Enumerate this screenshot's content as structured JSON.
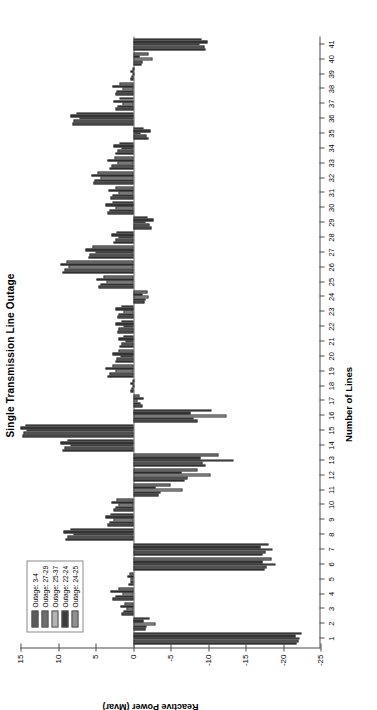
{
  "figure": {
    "title": "Single Transmission Line Outage",
    "xlabel": "Number of Lines",
    "ylabel": "Reactive Power (Mvar)"
  },
  "legend": {
    "items": [
      {
        "label": "Outage: 3-4",
        "color": "#5a5a5a"
      },
      {
        "label": "Outage: 27-29",
        "color": "#6e6e6e"
      },
      {
        "label": "Outage: 25-37",
        "color": "#b4b4b4"
      },
      {
        "label": "Outage: 22-24",
        "color": "#3c3c3c"
      },
      {
        "label": "Outage: 24-25",
        "color": "#909090"
      }
    ]
  },
  "axis": {
    "y_ticks": [
      15,
      10,
      5,
      0,
      -5,
      -10,
      -15,
      -20,
      -25
    ],
    "y_min": -25,
    "y_max": 15,
    "x_ticks": [
      1,
      2,
      3,
      4,
      5,
      6,
      7,
      8,
      9,
      10,
      11,
      12,
      13,
      14,
      15,
      16,
      17,
      18,
      19,
      20,
      21,
      22,
      23,
      24,
      25,
      26,
      27,
      28,
      29,
      30,
      31,
      32,
      33,
      34,
      35,
      36,
      37,
      38,
      39,
      40,
      41
    ],
    "x_min": 0.4,
    "x_max": 41.6
  },
  "chart_data": {
    "type": "bar",
    "title": "Single Transmission Line Outage",
    "xlabel": "Number of Lines",
    "ylabel": "Reactive Power (Mvar)",
    "ylim": [
      -25,
      15
    ],
    "grid": false,
    "legend_position": "top-left",
    "orientation": "vertical-grouped",
    "categories": [
      1,
      2,
      3,
      4,
      5,
      6,
      7,
      8,
      9,
      10,
      11,
      12,
      13,
      14,
      15,
      16,
      17,
      18,
      19,
      20,
      21,
      22,
      23,
      24,
      25,
      26,
      27,
      28,
      29,
      30,
      31,
      32,
      33,
      34,
      35,
      36,
      37,
      38,
      39,
      40,
      41
    ],
    "series": [
      {
        "name": "Outage: 3-4",
        "color": "#5a5a5a",
        "values": [
          -21.8,
          -1.6,
          1.5,
          2.7,
          0.6,
          -17.5,
          -17.3,
          9.0,
          3.4,
          2.6,
          -3.4,
          -6.9,
          -9.6,
          9.4,
          14.8,
          -8.6,
          -1.2,
          0.3,
          3.4,
          2.4,
          1.8,
          2.1,
          2.1,
          -1.5,
          4.6,
          9.4,
          6.0,
          2.6,
          -2.4,
          3.4,
          3.0,
          5.3,
          3.1,
          2.3,
          -2.0,
          8.1,
          2.3,
          2.4,
          0.3,
          -1.1,
          -9.7
        ]
      },
      {
        "name": "Outage: 27-29",
        "color": "#6e6e6e",
        "values": [
          -22.0,
          -1.8,
          1.3,
          2.4,
          0.4,
          -17.8,
          -17.6,
          8.8,
          3.2,
          2.4,
          -3.6,
          -7.2,
          -9.2,
          9.2,
          14.6,
          -8.0,
          -1.0,
          0.2,
          3.2,
          2.2,
          1.6,
          1.9,
          1.9,
          -1.7,
          4.4,
          9.2,
          5.8,
          2.4,
          -2.2,
          3.2,
          2.8,
          5.1,
          2.9,
          2.1,
          -1.8,
          7.9,
          2.1,
          2.2,
          0.2,
          -1.3,
          -9.5
        ]
      },
      {
        "name": "Outage: 25-37",
        "color": "#b4b4b4",
        "values": [
          -22.2,
          -3.0,
          0.9,
          1.4,
          0.3,
          -19.0,
          -18.6,
          8.0,
          2.6,
          1.9,
          -6.6,
          -10.3,
          -13.4,
          8.4,
          14.2,
          -12.5,
          -0.6,
          0.1,
          2.4,
          1.7,
          1.0,
          1.3,
          1.3,
          -2.0,
          3.6,
          8.6,
          5.0,
          1.9,
          -1.6,
          2.4,
          2.0,
          4.3,
          2.1,
          1.5,
          -1.0,
          7.2,
          1.4,
          1.4,
          0.1,
          -2.6,
          -8.8
        ]
      },
      {
        "name": "Outage: 22-24",
        "color": "#3c3c3c",
        "values": [
          -21.6,
          -1.4,
          1.7,
          3.0,
          0.8,
          -17.2,
          -17.0,
          9.3,
          3.7,
          2.9,
          -3.0,
          -6.4,
          -9.0,
          9.7,
          15.0,
          -7.6,
          -1.4,
          0.4,
          3.7,
          2.7,
          2.0,
          2.4,
          2.4,
          -1.3,
          4.9,
          9.7,
          6.3,
          2.9,
          -2.7,
          3.7,
          3.3,
          5.6,
          3.4,
          2.6,
          -2.3,
          8.4,
          2.6,
          2.7,
          0.4,
          -0.9,
          -9.9
        ]
      },
      {
        "name": "Outage: 24-25",
        "color": "#909090",
        "values": [
          -22.4,
          -2.2,
          1.1,
          2.0,
          0.5,
          -18.4,
          -18.1,
          8.4,
          3.0,
          2.2,
          -5.0,
          -8.6,
          -11.4,
          8.8,
          14.4,
          -10.5,
          -0.8,
          0.1,
          2.8,
          2.0,
          1.3,
          1.6,
          1.6,
          -1.9,
          4.0,
          8.9,
          5.4,
          2.2,
          -1.9,
          2.8,
          2.4,
          4.7,
          2.5,
          1.8,
          -1.4,
          7.6,
          1.8,
          1.8,
          0.1,
          -2.0,
          -9.1
        ]
      }
    ]
  }
}
